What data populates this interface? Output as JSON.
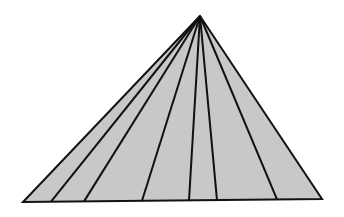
{
  "diagram": {
    "title": "",
    "type": "triangle-fan",
    "colors": {
      "background": "#ffffff",
      "fill": "#c8c8c8",
      "stroke": "#111111"
    },
    "stroke_width": 2,
    "apex": [
      200,
      16
    ],
    "base_left": [
      23,
      202
    ],
    "base_right": [
      322,
      199
    ],
    "interior_line_base_x": [
      51,
      84,
      142,
      189,
      217,
      277
    ],
    "segment_count": 7
  }
}
